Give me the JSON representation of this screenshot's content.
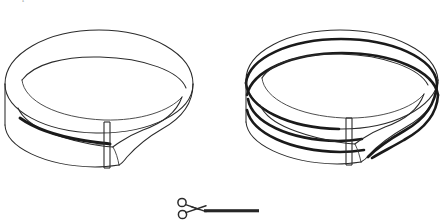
{
  "page": {
    "background_color": "#ffffff",
    "width": 443,
    "height": 222,
    "clipped_top_caption": "p"
  },
  "figures": [
    {
      "id": "left-band",
      "name": "mobius-band-single-cut",
      "description": "Möbius band drawn as a twisted ring with one heavy cut line along its length",
      "cut_line_count": 1,
      "has_seam": true,
      "stroke_color": "#2b2b2b",
      "cut_color": "#1a1a1a"
    },
    {
      "id": "right-band",
      "name": "mobius-band-multi-cut",
      "description": "Möbius band drawn as a twisted ring with multiple heavy cut lines running around it",
      "cut_line_count": 3,
      "has_seam": true,
      "stroke_color": "#2b2b2b",
      "cut_color": "#1a1a1a"
    }
  ],
  "cut_marker": {
    "name": "scissors-cut-here",
    "icon": "scissors-icon",
    "line_style": "solid-thick",
    "icon_color": "#2b2b2b",
    "line_color": "#262626"
  }
}
